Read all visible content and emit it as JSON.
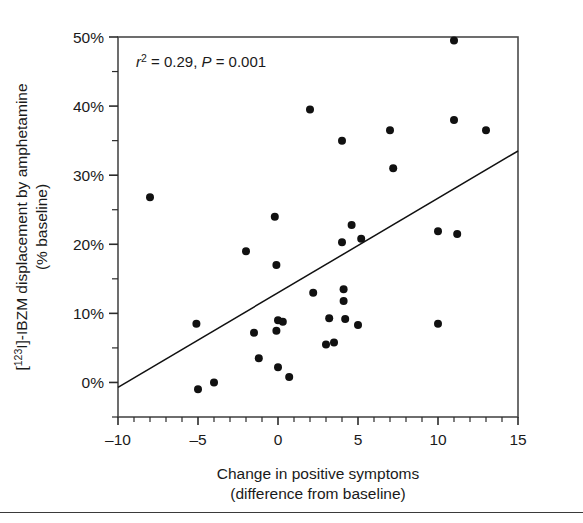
{
  "figure": {
    "name": "scatter-plot-ibzm-displacement"
  },
  "chart_data": {
    "type": "scatter",
    "title": "",
    "xlabel": "Change in positive symptoms",
    "xlabel_line2": "(difference from baseline)",
    "ylabel": "[123I]-IBZM displacement by amphetamine",
    "ylabel_line2": "(% baseline)",
    "ylabel_prefix": "[",
    "ylabel_superscript": "123",
    "ylabel_suffix": "I]-IBZM displacement by amphetamine",
    "xlim": [
      -10,
      15
    ],
    "ylim": [
      -5,
      50
    ],
    "xticks": [
      -10,
      -5,
      0,
      5,
      10,
      15
    ],
    "xtick_labels": [
      "–10",
      "–5",
      "0",
      "5",
      "10",
      "15"
    ],
    "yticks": [
      0,
      10,
      20,
      30,
      40,
      50
    ],
    "ytick_labels": [
      "0%",
      "10%",
      "20%",
      "30%",
      "40%",
      "50%"
    ],
    "x_minor_step": 1,
    "y_minor_step": 5,
    "grid": false,
    "legend": "none",
    "marker": "filled-circle",
    "marker_color": "#111111",
    "annotation": {
      "r_symbol": "r",
      "r_superscript": "2",
      "r_value": "= 0.29,",
      "p_symbol": "P",
      "p_value": "= 0.001",
      "full_text": "r2 = 0.29, P = 0.001"
    },
    "regression_line": {
      "x_start": -10,
      "y_start": -0.7,
      "x_end": 15,
      "y_end": 33.5,
      "color": "#111111"
    },
    "points": [
      {
        "x": -8.0,
        "y": 26.8
      },
      {
        "x": -5.1,
        "y": 8.5
      },
      {
        "x": -5.0,
        "y": -1.0
      },
      {
        "x": -4.0,
        "y": 0.0
      },
      {
        "x": -2.0,
        "y": 19.0
      },
      {
        "x": -1.5,
        "y": 7.2
      },
      {
        "x": -1.2,
        "y": 3.5
      },
      {
        "x": -0.2,
        "y": 24.0
      },
      {
        "x": -0.1,
        "y": 17.0
      },
      {
        "x": 0.0,
        "y": 9.0
      },
      {
        "x": -0.1,
        "y": 7.5
      },
      {
        "x": 0.3,
        "y": 8.8
      },
      {
        "x": 0.0,
        "y": 2.2
      },
      {
        "x": 0.7,
        "y": 0.8
      },
      {
        "x": 2.0,
        "y": 39.5
      },
      {
        "x": 2.2,
        "y": 13.0
      },
      {
        "x": 3.0,
        "y": 5.5
      },
      {
        "x": 3.2,
        "y": 9.3
      },
      {
        "x": 3.5,
        "y": 5.8
      },
      {
        "x": 4.0,
        "y": 35.0
      },
      {
        "x": 4.0,
        "y": 20.3
      },
      {
        "x": 4.1,
        "y": 13.5
      },
      {
        "x": 4.1,
        "y": 11.8
      },
      {
        "x": 4.2,
        "y": 9.2
      },
      {
        "x": 4.6,
        "y": 22.8
      },
      {
        "x": 5.0,
        "y": 8.3
      },
      {
        "x": 5.2,
        "y": 20.8
      },
      {
        "x": 7.0,
        "y": 36.5
      },
      {
        "x": 7.2,
        "y": 31.0
      },
      {
        "x": 10.0,
        "y": 21.9
      },
      {
        "x": 10.0,
        "y": 8.5
      },
      {
        "x": 11.0,
        "y": 49.5
      },
      {
        "x": 11.0,
        "y": 38.0
      },
      {
        "x": 11.2,
        "y": 21.5
      },
      {
        "x": 13.0,
        "y": 36.5
      }
    ]
  }
}
